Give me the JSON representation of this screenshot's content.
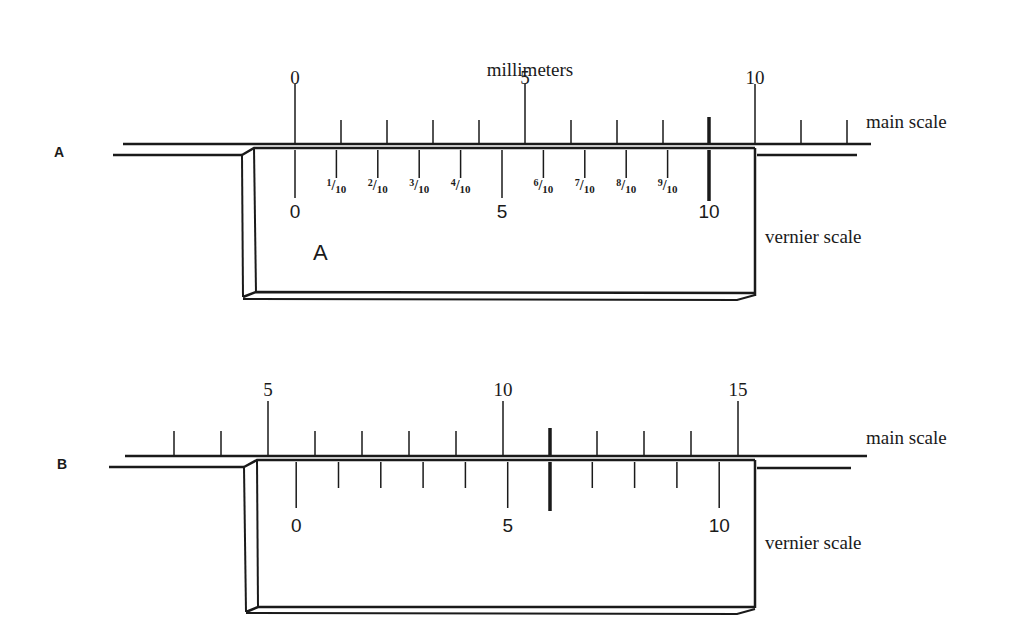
{
  "title": "millimeters",
  "diagrams": [
    {
      "id": "A",
      "panel_label": "A",
      "inner_label": "A",
      "main_scale_label": "main scale",
      "vernier_scale_label": "vernier scale",
      "main_scale": {
        "start_mm": 0,
        "end_mm": 13,
        "labels": [
          {
            "mm": 0,
            "text": "0"
          },
          {
            "mm": 5,
            "text": "5"
          },
          {
            "mm": 10,
            "text": "10"
          }
        ],
        "highlighted_mm": 9
      },
      "vernier_scale": {
        "divisions": 10,
        "labels": [
          {
            "div": 0,
            "text": "0"
          },
          {
            "div": 1,
            "text": "1/10"
          },
          {
            "div": 2,
            "text": "2/10"
          },
          {
            "div": 3,
            "text": "3/10"
          },
          {
            "div": 4,
            "text": "4/10"
          },
          {
            "div": 5,
            "text": "5"
          },
          {
            "div": 6,
            "text": "6/10"
          },
          {
            "div": 7,
            "text": "7/10"
          },
          {
            "div": 8,
            "text": "8/10"
          },
          {
            "div": 9,
            "text": "9/10"
          },
          {
            "div": 10,
            "text": "10"
          }
        ],
        "highlighted_div": 10,
        "zero_at_mm": 0
      }
    },
    {
      "id": "B",
      "panel_label": "B",
      "main_scale_label": "main scale",
      "vernier_scale_label": "vernier scale",
      "main_scale": {
        "start_mm": 3,
        "end_mm": 15,
        "labels": [
          {
            "mm": 5,
            "text": "5"
          },
          {
            "mm": 10,
            "text": "10"
          },
          {
            "mm": 15,
            "text": "15"
          }
        ],
        "highlighted_mm": 11
      },
      "vernier_scale": {
        "divisions": 10,
        "labels": [
          {
            "div": 0,
            "text": "0"
          },
          {
            "div": 5,
            "text": "5"
          },
          {
            "div": 10,
            "text": "10"
          }
        ],
        "highlighted_div": 6,
        "zero_at_mm": 5.6
      }
    }
  ]
}
